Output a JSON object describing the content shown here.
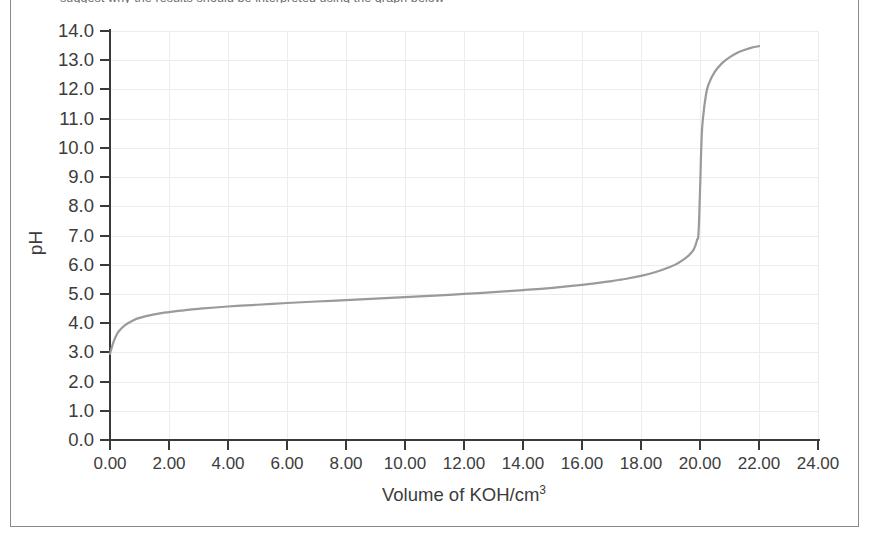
{
  "figure": {
    "top_caption_clipped": "suggest why the results should be interpreted using the graph below",
    "frame_color": "#8a8a8a",
    "background": "#ffffff"
  },
  "chart_data": {
    "type": "line",
    "title": "",
    "subtitle": "",
    "xlabel": "Volume of KOH/cm",
    "xlabel_superscript": "3",
    "ylabel": "pH",
    "xlim": [
      0,
      24
    ],
    "ylim": [
      0,
      14
    ],
    "grid": true,
    "legend": "none",
    "series_color": "#9a9a9a",
    "axis_color": "#3a3a3a",
    "gridline_color": "#ececec",
    "xticks": [
      "0.00",
      "2.00",
      "4.00",
      "6.00",
      "8.00",
      "10.00",
      "12.00",
      "14.00",
      "16.00",
      "18.00",
      "20.00",
      "22.00",
      "24.00"
    ],
    "xtick_values": [
      0,
      2,
      4,
      6,
      8,
      10,
      12,
      14,
      16,
      18,
      20,
      22,
      24
    ],
    "yticks": [
      "14.0",
      "13.0",
      "12.0",
      "11.0",
      "10.0",
      "9.0",
      "8.0",
      "7.0",
      "6.0",
      "5.0",
      "4.0",
      "3.0",
      "2.0",
      "1.0",
      "0.0"
    ],
    "ytick_values": [
      14,
      13,
      12,
      11,
      10,
      9,
      8,
      7,
      6,
      5,
      4,
      3,
      2,
      1,
      0
    ],
    "series": [
      {
        "name": "Titration curve of weak acid with KOH",
        "x": [
          0.0,
          0.1,
          0.2,
          0.3,
          0.5,
          0.75,
          1.0,
          1.5,
          2.0,
          2.5,
          3.0,
          4.0,
          5.0,
          6.0,
          7.0,
          8.0,
          9.0,
          10.0,
          11.0,
          12.0,
          13.0,
          14.0,
          15.0,
          16.0,
          17.0,
          17.5,
          18.0,
          18.5,
          19.0,
          19.25,
          19.5,
          19.65,
          19.8,
          19.9,
          19.95,
          20.0,
          20.05,
          20.1,
          20.2,
          20.3,
          20.5,
          20.75,
          21.0,
          21.25,
          21.5,
          21.75,
          22.0
        ],
        "y": [
          2.95,
          3.3,
          3.55,
          3.72,
          3.92,
          4.07,
          4.18,
          4.3,
          4.38,
          4.44,
          4.49,
          4.57,
          4.63,
          4.69,
          4.74,
          4.79,
          4.84,
          4.89,
          4.94,
          5.0,
          5.06,
          5.13,
          5.21,
          5.31,
          5.44,
          5.52,
          5.62,
          5.75,
          5.93,
          6.05,
          6.22,
          6.35,
          6.55,
          6.85,
          7.1,
          8.5,
          10.2,
          11.0,
          11.8,
          12.2,
          12.6,
          12.9,
          13.1,
          13.25,
          13.35,
          13.43,
          13.48
        ]
      }
    ],
    "annotations": [
      {
        "label": "equivalence-point-volume",
        "value": 20.0
      },
      {
        "label": "initial-pH",
        "value": 2.95
      },
      {
        "label": "final-plateau-pH",
        "value": 13.5
      }
    ]
  }
}
